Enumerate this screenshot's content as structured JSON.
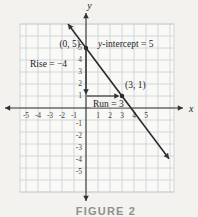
{
  "figure": {
    "caption": "FIGURE 2",
    "axis_labels": {
      "x": "x",
      "y": "y"
    },
    "x_tick_labels": [
      "-5",
      "-4",
      "-3",
      "-2",
      "-1",
      "1",
      "2",
      "3",
      "4",
      "5"
    ],
    "y_tick_labels": [
      "5",
      "4",
      "3",
      "2",
      "1",
      "-1",
      "-2",
      "-3",
      "-4",
      "-5"
    ],
    "annotations": {
      "intercept_point": "(0, 5)",
      "intercept_note": "y-intercept = 5",
      "rise": "Rise = −4",
      "second_point": "(3, 1)",
      "run": "Run = 3"
    },
    "colors": {
      "page_bg": "#f3f2ee",
      "grid_bg": "#f9f9f6",
      "grid_line": "#c9ced6",
      "axis": "#333333",
      "line": "#2b2b2b",
      "text": "#1e1e1e",
      "tick_text": "#3e3e3e",
      "caption_text": "#90908d"
    }
  },
  "chart_data": {
    "type": "line",
    "xlabel": "x",
    "ylabel": "y",
    "xlim": [
      -5,
      5
    ],
    "ylim": [
      -5,
      5
    ],
    "grid": true,
    "x_ticks": [
      -5,
      -4,
      -3,
      -2,
      -1,
      1,
      2,
      3,
      4,
      5
    ],
    "y_ticks": [
      5,
      4,
      3,
      2,
      1,
      -1,
      -2,
      -3,
      -4,
      -5
    ],
    "series": [
      {
        "name": "line",
        "points": [
          [
            0,
            5
          ],
          [
            3,
            1
          ]
        ],
        "rise": -4,
        "run": 3,
        "y_intercept": 5
      }
    ],
    "labeled_points": [
      {
        "x": 0,
        "y": 5,
        "label": "(0, 5)"
      },
      {
        "x": 3,
        "y": 1,
        "label": "(3, 1)"
      }
    ],
    "caption": "FIGURE 2"
  }
}
